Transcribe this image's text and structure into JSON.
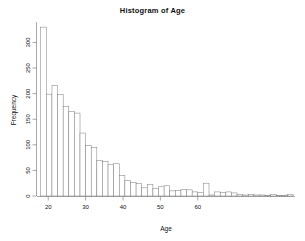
{
  "chart_data": {
    "type": "bar",
    "title": "Histogram of Age",
    "xlabel": "Age",
    "ylabel": "Frequency",
    "xlim": [
      17.0,
      86.0
    ],
    "ylim": [
      0,
      340
    ],
    "grid": false,
    "legend": null,
    "bin_width": 1.5,
    "xticks": [
      20,
      30,
      40,
      50,
      60
    ],
    "yticks": [
      0,
      50,
      100,
      150,
      200,
      250,
      300
    ],
    "bin_starts": [
      18.0,
      19.5,
      21.0,
      22.5,
      24.0,
      25.5,
      27.0,
      28.5,
      30.0,
      31.5,
      33.0,
      34.5,
      36.0,
      37.5,
      39.0,
      40.5,
      42.0,
      43.5,
      45.0,
      46.5,
      48.0,
      49.5,
      51.0,
      52.5,
      54.0,
      55.5,
      57.0,
      58.5,
      60.0,
      61.5,
      63.0,
      64.5,
      66.0,
      67.5,
      69.0,
      70.5,
      72.0,
      73.5,
      75.0,
      76.5,
      78.0,
      79.5,
      81.0,
      82.5,
      84.0
    ],
    "categories": [
      "18.0",
      "19.5",
      "21.0",
      "22.5",
      "24.0",
      "25.5",
      "27.0",
      "28.5",
      "30.0",
      "31.5",
      "33.0",
      "34.5",
      "36.0",
      "37.5",
      "39.0",
      "40.5",
      "42.0",
      "43.5",
      "45.0",
      "46.5",
      "48.0",
      "49.5",
      "51.0",
      "52.5",
      "54.0",
      "55.5",
      "57.0",
      "58.5",
      "60.0",
      "61.5",
      "63.0",
      "64.5",
      "66.0",
      "67.5",
      "69.0",
      "70.5",
      "72.0",
      "73.5",
      "75.0",
      "76.5",
      "78.0",
      "79.5",
      "81.0",
      "82.5",
      "84.0"
    ],
    "values": [
      330,
      199,
      216,
      198,
      175,
      165,
      162,
      123,
      99,
      95,
      69,
      67,
      61,
      63,
      40,
      30,
      26,
      24,
      16,
      23,
      15,
      18,
      20,
      10,
      11,
      13,
      12,
      8,
      7,
      25,
      2,
      8,
      7,
      8,
      6,
      3,
      2,
      3,
      2,
      2,
      1,
      3,
      1,
      1,
      3
    ]
  },
  "figure": {
    "title": "Histogram of Age",
    "x_axis_label": "Age",
    "y_axis_label": "Frequency"
  }
}
